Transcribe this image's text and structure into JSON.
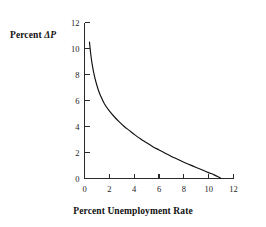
{
  "chart_data": {
    "type": "line",
    "title": "",
    "subtitle": "",
    "xlabel": "Percent Unemployment Rate",
    "ylabel": "Percent ΔP",
    "ylabel_prefix": "Percent ",
    "ylabel_symbol": "ΔP",
    "xlim": [
      0,
      12
    ],
    "ylim": [
      0,
      12
    ],
    "xticks": [
      0,
      2,
      4,
      6,
      8,
      10,
      12
    ],
    "yticks": [
      0,
      2,
      4,
      6,
      8,
      10,
      12
    ],
    "xtick_labels": [
      "0",
      "2",
      "4",
      "6",
      "8",
      "10",
      "12"
    ],
    "ytick_labels": [
      "0",
      "2",
      "4",
      "6",
      "8",
      "10",
      "12"
    ],
    "grid": false,
    "legend": null,
    "legend_position": "none",
    "series": [
      {
        "name": "Phillips curve",
        "color": "#111111",
        "x": [
          0.4,
          0.5,
          0.6,
          0.75,
          0.9,
          1.1,
          1.3,
          1.6,
          2.0,
          2.4,
          2.8,
          3.2,
          3.6,
          4.0,
          4.5,
          5.0,
          5.5,
          6.0,
          6.5,
          7.0,
          7.5,
          8.0,
          8.5,
          9.0,
          9.5,
          10.0,
          10.4,
          10.8,
          11.0
        ],
        "y": [
          10.5,
          9.6,
          8.9,
          8.1,
          7.5,
          6.85,
          6.35,
          5.75,
          5.2,
          4.75,
          4.35,
          4.0,
          3.7,
          3.4,
          3.05,
          2.75,
          2.45,
          2.2,
          1.95,
          1.7,
          1.48,
          1.25,
          1.05,
          0.85,
          0.65,
          0.45,
          0.3,
          0.12,
          0.0
        ]
      }
    ]
  },
  "figure": {
    "background_color": "#ffffff",
    "axis_color": "#2a2a2a",
    "curve_color": "#111111"
  }
}
